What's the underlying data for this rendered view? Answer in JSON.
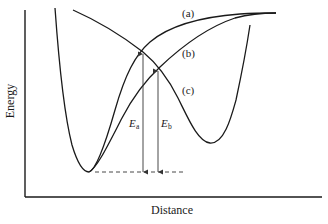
{
  "diagram": {
    "type": "potential-energy-curves",
    "axes": {
      "x_label": "Distance",
      "y_label": "Energy"
    },
    "curves": [
      {
        "id": "a",
        "label": "(a)"
      },
      {
        "id": "b",
        "label": "(b)"
      },
      {
        "id": "c",
        "label": "(c)"
      }
    ],
    "energies": [
      {
        "id": "Ea",
        "symbol": "E",
        "subscript": "a"
      },
      {
        "id": "Eb",
        "symbol": "E",
        "subscript": "b"
      }
    ],
    "colors": {
      "line": "#1a1a1a",
      "background": "#ffffff"
    }
  }
}
